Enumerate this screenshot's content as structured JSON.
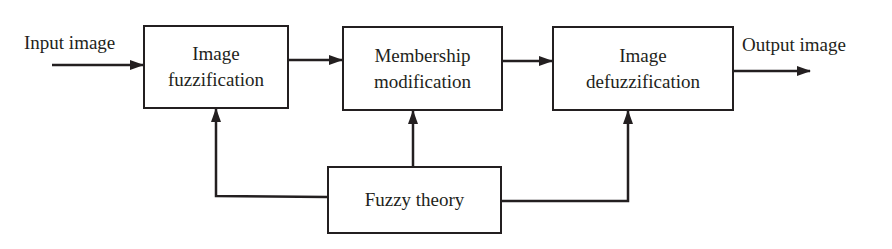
{
  "diagram": {
    "type": "block-diagram",
    "input_label": "Input image",
    "output_label": "Output image",
    "blocks": [
      {
        "id": "fuzzification",
        "line1": "Image",
        "line2": "fuzzification"
      },
      {
        "id": "membership",
        "line1": "Membership",
        "line2": "modification"
      },
      {
        "id": "defuzzification",
        "line1": "Image",
        "line2": "defuzzification"
      },
      {
        "id": "fuzzy-theory",
        "line1": "Fuzzy theory"
      }
    ],
    "edges": [
      {
        "from": "input",
        "to": "fuzzification"
      },
      {
        "from": "fuzzification",
        "to": "membership"
      },
      {
        "from": "membership",
        "to": "defuzzification"
      },
      {
        "from": "defuzzification",
        "to": "output"
      },
      {
        "from": "fuzzy-theory",
        "to": "fuzzification"
      },
      {
        "from": "fuzzy-theory",
        "to": "membership"
      },
      {
        "from": "fuzzy-theory",
        "to": "defuzzification"
      }
    ],
    "colors": {
      "stroke": "#231f20",
      "background": "#ffffff"
    }
  }
}
